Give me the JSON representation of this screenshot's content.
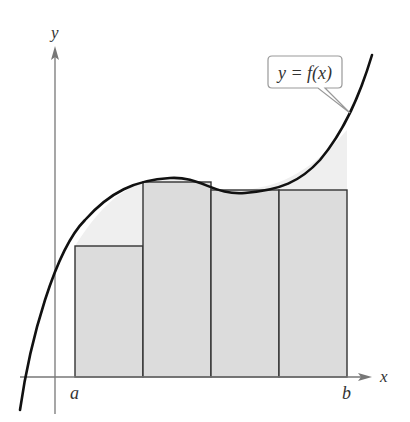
{
  "figure": {
    "axes": {
      "x_label": "x",
      "y_label": "y"
    },
    "interval": {
      "left_label": "a",
      "right_label": "b"
    },
    "callout": {
      "text": "y = f(x)"
    },
    "colors": {
      "rect_fill": "#dcdcdc",
      "excess_fill": "#efefef",
      "curve": "#111111",
      "axis": "#777777",
      "rect_stroke": "#333333"
    },
    "rectangles": [
      {
        "index": 1,
        "x0": 75,
        "x1": 143,
        "top": 246
      },
      {
        "index": 2,
        "x0": 143,
        "x1": 211,
        "top": 182
      },
      {
        "index": 3,
        "x0": 211,
        "x1": 279,
        "top": 190
      },
      {
        "index": 4,
        "x0": 279,
        "x1": 347,
        "top": 190
      }
    ]
  }
}
